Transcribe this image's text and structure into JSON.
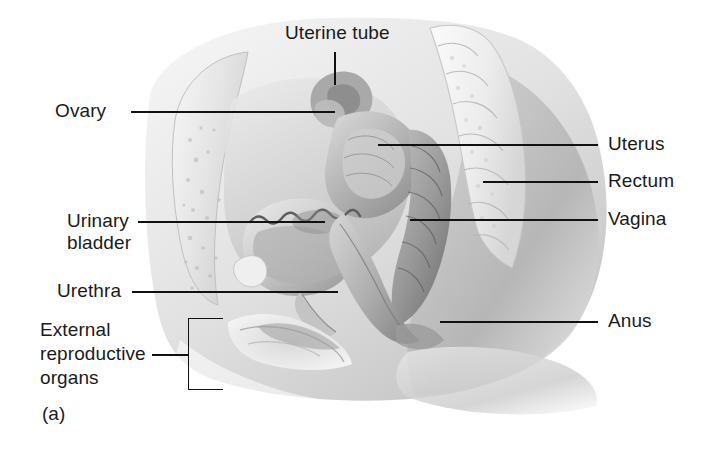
{
  "figure": {
    "caption": "(a)"
  },
  "labels": {
    "uterine_tube": "Uterine tube",
    "ovary": "Ovary",
    "urinary_bladder_line1": "Urinary",
    "urinary_bladder_line2": "bladder",
    "urethra": "Urethra",
    "external_line1": "External",
    "external_line2": "reproductive",
    "external_line3": "organs",
    "uterus": "Uterus",
    "rectum": "Rectum",
    "vagina": "Vagina",
    "anus": "Anus"
  },
  "colors": {
    "text": "#1a1a1a",
    "leader_line": "#111111",
    "background": "#ffffff",
    "tissue_light": "#e9e9e9",
    "tissue_mid": "#c9c9c9",
    "tissue_dark": "#9a9a9a",
    "tissue_deep": "#777777"
  }
}
